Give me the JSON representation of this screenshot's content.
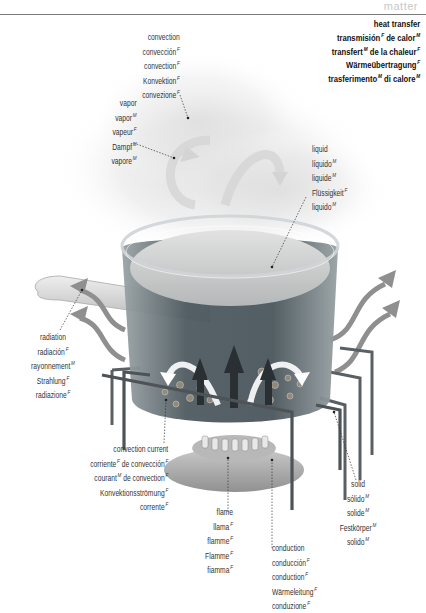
{
  "header": {
    "tag": "matter"
  },
  "title": {
    "lines": [
      {
        "text": "heat transfer",
        "g": ""
      },
      {
        "text": "transmisión",
        "g": "F",
        "rest": " de calor",
        "g2": "M"
      },
      {
        "text": "transfert",
        "g": "M",
        "rest": " de la chaleur",
        "g2": "F"
      },
      {
        "text": "Wärmeübertragung",
        "g": "F"
      },
      {
        "text": "trasferimento",
        "g": "M",
        "rest": " di calore",
        "g2": "M"
      }
    ]
  },
  "labels": {
    "convection": [
      {
        "text": "convection",
        "g": ""
      },
      {
        "text": "convección",
        "g": "F"
      },
      {
        "text": "convection",
        "g": "F"
      },
      {
        "text": "Konvektion",
        "g": "F"
      },
      {
        "text": "convezione",
        "g": "F"
      }
    ],
    "vapor": [
      {
        "text": "vapor",
        "g": ""
      },
      {
        "text": "vapor",
        "g": "M"
      },
      {
        "text": "vapeur",
        "g": "F"
      },
      {
        "text": "Dampf",
        "g": "M"
      },
      {
        "text": "vapore",
        "g": "M"
      }
    ],
    "liquid": [
      {
        "text": "liquid",
        "g": ""
      },
      {
        "text": "líquido",
        "g": "M"
      },
      {
        "text": "liquide",
        "g": "M"
      },
      {
        "text": "Flüssigkeit",
        "g": "F"
      },
      {
        "text": "liquido",
        "g": "M"
      }
    ],
    "radiation": [
      {
        "text": "radiation",
        "g": ""
      },
      {
        "text": "radiación",
        "g": "F"
      },
      {
        "text": "rayonnement",
        "g": "M"
      },
      {
        "text": "Strahlung",
        "g": "F"
      },
      {
        "text": "radiazione",
        "g": "F"
      }
    ],
    "convection_current": [
      {
        "text": "convection current",
        "g": ""
      },
      {
        "text": "corriente",
        "g": "F",
        "rest": " de convección",
        "g2": "F"
      },
      {
        "text": "courant",
        "g": "M",
        "rest": " de convection",
        "g2": "F"
      },
      {
        "text": "Konvektionsströmung",
        "g": "F"
      },
      {
        "text": "corrente",
        "g": "F",
        "rest": " di convezione",
        "g2": "F"
      }
    ],
    "flame": [
      {
        "text": "flame",
        "g": ""
      },
      {
        "text": "llama",
        "g": "F"
      },
      {
        "text": "flamme",
        "g": "F"
      },
      {
        "text": "Flamme",
        "g": "F"
      },
      {
        "text": "fiamma",
        "g": "F"
      }
    ],
    "conduction": [
      {
        "text": "conduction",
        "g": ""
      },
      {
        "text": "conducción",
        "g": "F"
      },
      {
        "text": "conduction",
        "g": "F"
      },
      {
        "text": "Wärmeleitung",
        "g": "F"
      },
      {
        "text": "conduzione",
        "g": "F"
      }
    ],
    "solid": [
      {
        "text": "solid",
        "g": ""
      },
      {
        "text": "sólido",
        "g": "M"
      },
      {
        "text": "solide",
        "g": "M"
      },
      {
        "text": "Festkörper",
        "g": "M"
      },
      {
        "text": "solido",
        "g": "M"
      }
    ]
  },
  "colors": {
    "arrow_gray": "#8c8c8c",
    "liquid_dark": "#3d4a50",
    "pot_glass": "#c9ced0",
    "stand_metal": "#555a5e"
  }
}
